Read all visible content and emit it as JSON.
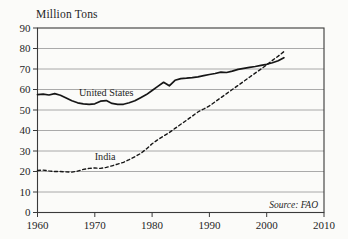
{
  "chart_data": {
    "type": "line",
    "title": "Million Tons",
    "source_note": "Source: FAO",
    "xlabel": "",
    "ylabel": "Million Tons",
    "xlim": [
      1960,
      2010
    ],
    "ylim": [
      0,
      90
    ],
    "xticks": [
      1960,
      1970,
      1980,
      1990,
      2000,
      2010
    ],
    "yticks": [
      0,
      10,
      20,
      30,
      40,
      50,
      60,
      70,
      80,
      90
    ],
    "grid": "horizontal",
    "legend": "inline-labels",
    "x": [
      1960,
      1961,
      1962,
      1963,
      1964,
      1965,
      1966,
      1967,
      1968,
      1969,
      1970,
      1971,
      1972,
      1973,
      1974,
      1975,
      1976,
      1977,
      1978,
      1979,
      1980,
      1981,
      1982,
      1983,
      1984,
      1985,
      1986,
      1987,
      1988,
      1989,
      1990,
      1991,
      1992,
      1993,
      1994,
      1995,
      1996,
      1997,
      1998,
      1999,
      2000,
      2001,
      2002,
      2003
    ],
    "series": [
      {
        "name": "United States",
        "style": "solid",
        "values": [
          57.5,
          57.7,
          57.3,
          58,
          57.2,
          55.8,
          54.5,
          53.5,
          53,
          52.8,
          53,
          54.3,
          54.6,
          53.2,
          52.8,
          52.8,
          53.5,
          54.5,
          56,
          57.5,
          59.5,
          61.5,
          63.5,
          61.8,
          64.5,
          65.3,
          65.5,
          65.8,
          66.2,
          66.8,
          67.3,
          67.8,
          68.5,
          68.3,
          69,
          69.8,
          70.3,
          70.8,
          71.2,
          71.8,
          72.3,
          73,
          74,
          75.5
        ]
      },
      {
        "name": "India",
        "style": "dashed",
        "values": [
          20.5,
          20.7,
          20.3,
          20,
          20,
          19.8,
          19.7,
          20.2,
          21,
          21.5,
          21.7,
          21.5,
          22,
          22.8,
          23.6,
          24.5,
          25.8,
          27.2,
          28.8,
          31,
          33.5,
          35.5,
          37.3,
          39,
          41,
          43,
          45,
          47,
          49,
          50.5,
          52,
          54,
          56,
          58,
          60,
          62,
          64,
          66,
          68,
          70,
          72,
          74.2,
          76.3,
          78.5
        ]
      }
    ],
    "series_labels": [
      {
        "text": "United States",
        "x": 1972,
        "y": 58.7
      },
      {
        "text": "India",
        "x": 1971.8,
        "y": 27.3
      }
    ]
  },
  "colors": {
    "background": "#fbfbf9",
    "line": "#161616",
    "grid": "#8f8f8f",
    "border": "#3a3a3a",
    "text": "#1f1f1f"
  }
}
